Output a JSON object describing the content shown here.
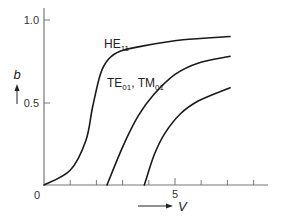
{
  "chart_data": {
    "type": "line",
    "title": "",
    "xlabel": "V",
    "ylabel": "b",
    "xlim": [
      0,
      8.8
    ],
    "ylim": [
      0,
      1.05
    ],
    "x_ticks": [
      0,
      1,
      2,
      3,
      4,
      5,
      6,
      7,
      8
    ],
    "x_tick_labels": {
      "0": "0",
      "5": "5"
    },
    "y_ticks": [
      0,
      0.5,
      1.0
    ],
    "y_tick_labels": [
      "0",
      "0.5",
      "1.0"
    ],
    "grid": false,
    "legend": "inline curve labels",
    "series": [
      {
        "name": "HE11",
        "label_main": "HE",
        "label_sub": "11",
        "x": [
          0,
          1.0,
          1.6,
          1.85,
          2.15,
          2.45,
          2.9,
          3.7,
          5.3,
          7.1
        ],
        "y": [
          0,
          0.09,
          0.27,
          0.47,
          0.67,
          0.76,
          0.81,
          0.84,
          0.88,
          0.9
        ]
      },
      {
        "name": "TE01, TM01",
        "label_main1": "TE",
        "label_sub1": "01",
        "label_sep": ", ",
        "label_main2": "TM",
        "label_sub2": "01",
        "x": [
          2.405,
          3.0,
          3.6,
          4.2,
          5.0,
          5.9,
          7.1
        ],
        "y": [
          0,
          0.23,
          0.42,
          0.55,
          0.67,
          0.74,
          0.78
        ]
      },
      {
        "name": "higher mode",
        "x": [
          3.83,
          4.2,
          4.6,
          5.2,
          5.9,
          7.1
        ],
        "y": [
          0,
          0.18,
          0.31,
          0.43,
          0.51,
          0.59
        ]
      }
    ],
    "annotations": [
      "b axis arrow (upward)",
      "V axis arrow (rightward)"
    ]
  }
}
